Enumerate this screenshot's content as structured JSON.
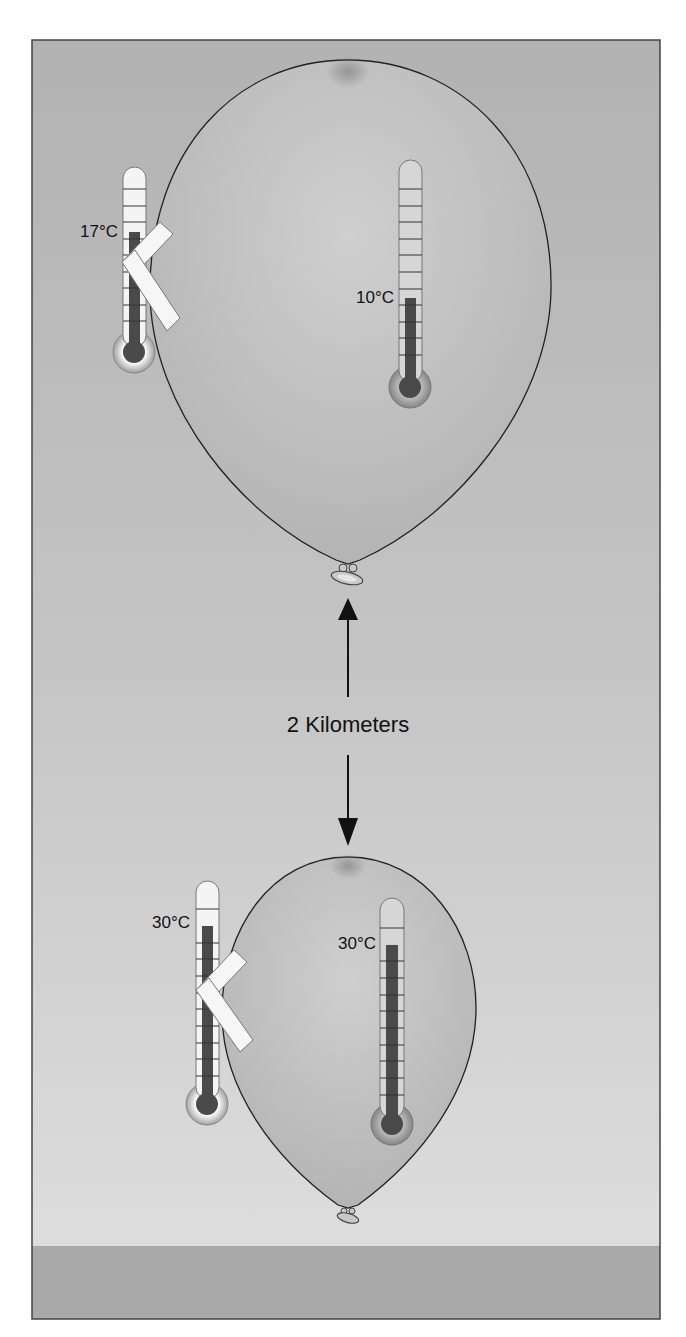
{
  "figure": {
    "distance_label": "2 Kilometers",
    "upper_balloon": {
      "outside_thermometer": {
        "label": "17°C",
        "value_c": 17
      },
      "inside_thermometer": {
        "label": "10°C",
        "value_c": 10
      }
    },
    "lower_balloon": {
      "outside_thermometer": {
        "label": "30°C",
        "value_c": 30
      },
      "inside_thermometer": {
        "label": "30°C",
        "value_c": 30
      }
    },
    "colors": {
      "sky_top": "#b3b3b3",
      "sky_bottom": "#dedede",
      "ground": "#a9a9a9",
      "balloon_fill": "#c2c2c2",
      "mercury": "#4a4a4a",
      "outline": "#222222"
    }
  }
}
